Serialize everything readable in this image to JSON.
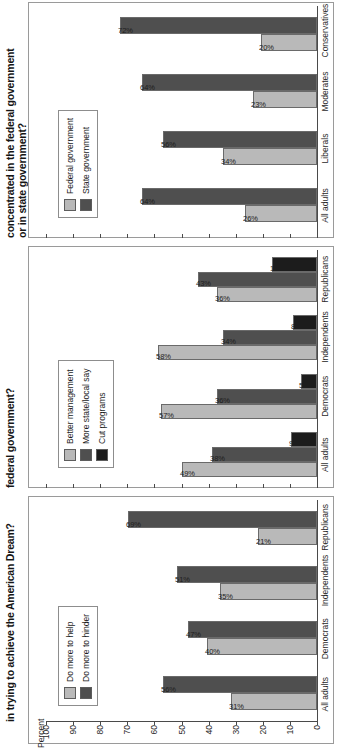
{
  "chart_data": [
    {
      "type": "bar",
      "title": "in trying to achieve the American Dream?",
      "ylabel": "Percent",
      "xlabel": "",
      "ylim": [
        0,
        100
      ],
      "yticks": [
        100,
        90,
        80,
        70,
        60,
        50,
        40,
        30,
        20,
        10,
        0
      ],
      "grid": false,
      "legend_position": "upper-left",
      "categories": [
        "All adults",
        "Democrats",
        "Independents",
        "Republicans"
      ],
      "series": [
        {
          "name": "Do more to help",
          "color": "#b9b9b9",
          "values": [
            31,
            40,
            35,
            21
          ],
          "labels": [
            "31%",
            "40%",
            "35%",
            "21%"
          ]
        },
        {
          "name": "Do more to hinder",
          "color": "#4f4f4f",
          "values": [
            56,
            47,
            51,
            69
          ],
          "labels": [
            "56%",
            "47%",
            "51%",
            "69%"
          ]
        }
      ]
    },
    {
      "type": "bar",
      "title": "federal government?",
      "ylabel": "",
      "xlabel": "",
      "ylim": [
        0,
        100
      ],
      "yticks": [
        100,
        90,
        80,
        70,
        60,
        50,
        40,
        30,
        20,
        10,
        0
      ],
      "grid": false,
      "legend_position": "upper-left",
      "categories": [
        "All adults",
        "Democrats",
        "Independents",
        "Republicans"
      ],
      "series": [
        {
          "name": "Better management",
          "color": "#b9b9b9",
          "values": [
            49,
            57,
            58,
            36
          ],
          "labels": [
            "49%",
            "57%",
            "58%",
            "36%"
          ]
        },
        {
          "name": "More state/local say",
          "color": "#4f4f4f",
          "values": [
            38,
            36,
            34,
            43
          ],
          "labels": [
            "38%",
            "36%",
            "34%",
            "43%"
          ]
        },
        {
          "name": "Cut programs",
          "color": "#1c1c1c",
          "values": [
            9,
            5,
            8,
            16
          ],
          "labels": [
            "9%",
            "5%",
            "8%",
            "16%"
          ]
        }
      ]
    },
    {
      "type": "bar",
      "title": "concentrated in the federal government or in state government?",
      "ylabel": "",
      "xlabel": "",
      "ylim": [
        0,
        100
      ],
      "yticks": [
        100,
        90,
        80,
        70,
        60,
        50,
        40,
        30,
        20,
        10,
        0
      ],
      "grid": false,
      "legend_position": "upper-left",
      "categories": [
        "All adults",
        "Liberals",
        "Moderates",
        "Conservatives"
      ],
      "series": [
        {
          "name": "Federal government",
          "color": "#b9b9b9",
          "values": [
            26,
            34,
            23,
            20
          ],
          "labels": [
            "26%",
            "34%",
            "23%",
            "20%"
          ]
        },
        {
          "name": "State government",
          "color": "#4f4f4f",
          "values": [
            64,
            56,
            64,
            72
          ],
          "labels": [
            "64%",
            "56%",
            "64%",
            "72%"
          ]
        }
      ]
    }
  ],
  "panels": [
    {
      "title_lines": [
        "in trying to achieve the American Dream?"
      ],
      "axis_unit": "Percent"
    },
    {
      "title_lines": [
        "federal government?"
      ],
      "axis_unit": ""
    },
    {
      "title_lines": [
        "concentrated in the federal government",
        "or in state government?"
      ],
      "axis_unit": ""
    }
  ]
}
